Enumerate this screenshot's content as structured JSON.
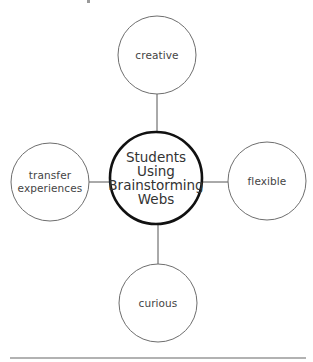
{
  "diagram": {
    "type": "brainstorming-web",
    "center": {
      "lines": [
        "Students",
        "Using",
        "Brainstorming",
        "Webs"
      ],
      "cx": 156,
      "cy": 178,
      "r": 46,
      "stroke": "#111111",
      "stroke_width": 2.6
    },
    "nodes": [
      {
        "id": "creative",
        "lines": [
          "creative"
        ],
        "cx": 157,
        "cy": 55,
        "r": 39,
        "position": "top"
      },
      {
        "id": "transfer-experiences",
        "lines": [
          "transfer",
          "experiences"
        ],
        "cx": 50,
        "cy": 182,
        "r": 39,
        "position": "left"
      },
      {
        "id": "flexible",
        "lines": [
          "flexible"
        ],
        "cx": 267,
        "cy": 181,
        "r": 39,
        "position": "right"
      },
      {
        "id": "curious",
        "lines": [
          "curious"
        ],
        "cx": 158,
        "cy": 303,
        "r": 39,
        "position": "bottom"
      }
    ],
    "connectors": [
      {
        "from": "center",
        "to": "creative",
        "x1": 157,
        "y1": 94,
        "x2": 157,
        "y2": 132
      },
      {
        "from": "center",
        "to": "transfer-experiences",
        "x1": 89,
        "y1": 182,
        "x2": 110,
        "y2": 182
      },
      {
        "from": "center",
        "to": "flexible",
        "x1": 202,
        "y1": 182,
        "x2": 228,
        "y2": 182
      },
      {
        "from": "center",
        "to": "curious",
        "x1": 158,
        "y1": 224,
        "x2": 158,
        "y2": 264
      }
    ],
    "node_stroke": "#6e6e6e",
    "connector_stroke": "#555555",
    "rule": {
      "x1": 10,
      "x2": 306,
      "y": 358,
      "stroke": "#666666"
    }
  },
  "labels": {
    "center": [
      "Students",
      "Using",
      "Brainstorming",
      "Webs"
    ],
    "creative": "creative",
    "transfer_1": "transfer",
    "transfer_2": "experiences",
    "flexible": "flexible",
    "curious": "curious"
  }
}
